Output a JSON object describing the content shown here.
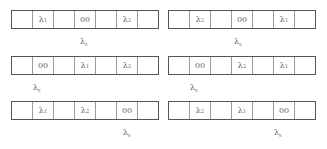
{
  "diagram": {
    "symbol": "λ",
    "panels": [
      {
        "position": "row1-left",
        "cells": [
          "",
          "λ1",
          "",
          "00",
          "",
          "λ2",
          ""
        ],
        "marker": {
          "base": "λ",
          "sub": "s",
          "cell_index": 3
        }
      },
      {
        "position": "row1-right",
        "cells": [
          "",
          "λ2",
          "",
          "00",
          "",
          "λ1",
          ""
        ],
        "marker": {
          "base": "λ",
          "sub": "s",
          "cell_index": 3
        }
      },
      {
        "position": "row2-left",
        "cells": [
          "",
          "00",
          "",
          "λ1",
          "",
          "λ2",
          ""
        ],
        "marker": {
          "base": "λ",
          "sub": "s",
          "cell_index": 1
        }
      },
      {
        "position": "row2-right",
        "cells": [
          "",
          "00",
          "",
          "λ2",
          "",
          "λ1",
          ""
        ],
        "marker": {
          "base": "λ",
          "sub": "s",
          "cell_index": 1
        }
      },
      {
        "position": "row3-left",
        "cells": [
          "",
          "λ1",
          "",
          "λ2",
          "",
          "00",
          ""
        ],
        "marker": {
          "base": "λ",
          "sub": "s",
          "cell_index": 5
        }
      },
      {
        "position": "row3-right",
        "cells": [
          "",
          "λ2",
          "",
          "λ1",
          "",
          "00",
          ""
        ],
        "marker": {
          "base": "λ",
          "sub": "s",
          "cell_index": 5
        }
      }
    ]
  },
  "labels": {
    "p0": {
      "c1": {
        "base": "λ",
        "sub": "1"
      },
      "c3": "00",
      "c5": {
        "base": "λ",
        "sub": "2"
      }
    },
    "p1": {
      "c1": {
        "base": "λ",
        "sub": "2"
      },
      "c3": "00",
      "c5": {
        "base": "λ",
        "sub": "1"
      }
    },
    "p2": {
      "c1": "00",
      "c3": {
        "base": "λ",
        "sub": "1"
      },
      "c5": {
        "base": "λ",
        "sub": "2"
      }
    },
    "p3": {
      "c1": "00",
      "c3": {
        "base": "λ",
        "sub": "2"
      },
      "c5": {
        "base": "λ",
        "sub": "1"
      }
    },
    "p4": {
      "c1": {
        "base": "λ",
        "sub": "1"
      },
      "c3": {
        "base": "λ",
        "sub": "2"
      },
      "c5": "00"
    },
    "p5": {
      "c1": {
        "base": "λ",
        "sub": "2"
      },
      "c3": {
        "base": "λ",
        "sub": "1"
      },
      "c5": "00"
    },
    "marker": {
      "base": "λ",
      "sub": "s"
    }
  }
}
